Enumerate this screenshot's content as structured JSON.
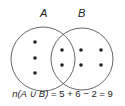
{
  "diagram": {
    "type": "venn",
    "sets": [
      {
        "label": "A",
        "cx": 43,
        "cy": 59,
        "r": 32,
        "only_count": 3
      },
      {
        "label": "B",
        "cx": 82,
        "cy": 59,
        "r": 31,
        "only_count": 4
      }
    ],
    "intersection_count": 2,
    "dots": [
      {
        "region": "A-only",
        "x": 35,
        "y": 42
      },
      {
        "region": "A-only",
        "x": 35,
        "y": 58
      },
      {
        "region": "A-only",
        "x": 35,
        "y": 73
      },
      {
        "region": "A∩B",
        "x": 62,
        "y": 50
      },
      {
        "region": "A∩B",
        "x": 62,
        "y": 65
      },
      {
        "region": "B-only",
        "x": 81,
        "y": 50
      },
      {
        "region": "B-only",
        "x": 81,
        "y": 65
      },
      {
        "region": "B-only",
        "x": 101,
        "y": 50
      },
      {
        "region": "B-only",
        "x": 101,
        "y": 65
      }
    ],
    "formula": {
      "lhs": "n(A ∪ B)",
      "rhs": "= 5 + 6 − 2 = 9"
    },
    "colors": {
      "stroke": "#555555",
      "dot": "#222222",
      "text": "#222222"
    }
  }
}
